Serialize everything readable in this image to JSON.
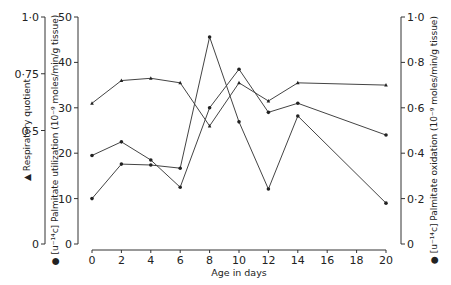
{
  "chart_data": {
    "type": "line",
    "title": "",
    "xlabel": "Age in days",
    "x": [
      0,
      2,
      4,
      6,
      8,
      10,
      12,
      14,
      20
    ],
    "xticks": [
      "0",
      "2",
      "4",
      "6",
      "8",
      "10",
      "12",
      "14",
      "16",
      "18",
      "20"
    ],
    "xlim": [
      0,
      20
    ],
    "axes": {
      "left_outer": {
        "label": "▲ Respiratory quotient",
        "ticks": [
          "0",
          "0·5",
          "0·75",
          "1·0"
        ],
        "ylim": [
          0,
          1.0
        ]
      },
      "left_inner": {
        "label": "● [u-14c] Palmitate utilization (10-9 moles/min/g tissue)",
        "ticks": [
          "0",
          "10",
          "20",
          "30",
          "40",
          "50"
        ],
        "ylim": [
          0,
          50
        ]
      },
      "right": {
        "label": "● [u-14c] Palmitate oxidation (10-9 moles/min/g tissue)",
        "ticks": [
          "0",
          "0·2",
          "0·4",
          "0·6",
          "0·8",
          "1·0"
        ],
        "ylim": [
          0,
          1.0
        ]
      }
    },
    "series": [
      {
        "name": "Respiratory quotient",
        "axis": "left_outer",
        "marker": "triangle",
        "values": [
          0.62,
          0.72,
          0.73,
          0.71,
          0.52,
          0.71,
          0.63,
          0.71,
          0.7
        ]
      },
      {
        "name": "[u-14c] Palmitate utilization",
        "axis": "left_inner",
        "marker": "dot",
        "values": [
          10,
          17.6,
          17.4,
          16.7,
          45.6,
          26.9,
          12.1,
          28.2,
          9.0
        ]
      },
      {
        "name": "[u-14c] Palmitate oxidation",
        "axis": "right",
        "marker": "dot",
        "values": [
          0.39,
          0.45,
          0.37,
          0.25,
          0.6,
          0.77,
          0.58,
          0.62,
          0.48
        ]
      }
    ],
    "grid": false,
    "legend": "none (markers described in axis labels)"
  },
  "labels": {
    "x_title": "Age in days",
    "rq_title": "▲ Respiratory quotient",
    "util_title": "● [u⁻¹⁴c] Palmitate utilization (10⁻⁹ moles/min/g tissue)",
    "oxid_title": "● [u⁻¹⁴c] Palmitate oxidation (10⁻⁹ moles/min/g tissue)"
  }
}
